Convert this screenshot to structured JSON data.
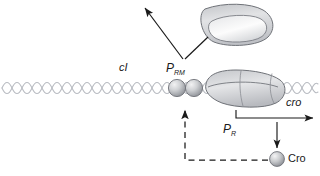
{
  "figure": {
    "background_color": "#ffffff",
    "stroke_color": "#1a1a1a",
    "dna_color": "#b9bcc2",
    "protein_fill": "#d9dadd"
  },
  "labels": {
    "ci_gene": "cI",
    "cro_gene": "cro",
    "prm_promoter_base": "P",
    "prm_promoter_sub": "RM",
    "pr_promoter_base": "P",
    "pr_promoter_sub": "R",
    "cro_protein": "Cro"
  },
  "elements": {
    "dna_strand": "double-helix-dna",
    "repressor_dimer_left": "ci-repressor-sphere-left",
    "repressor_dimer_right": "ci-repressor-sphere-right",
    "rna_polymerase_bound": "rna-polymerase-blob-bound",
    "rna_polymerase_free": "rna-polymerase-blob-free",
    "cro_sphere": "cro-protein-sphere",
    "pointer_arrow": "prm-pointer-arrow",
    "pointer_line": "prm-leader-line",
    "pr_transcription_arrow": "pr-transcription-arrow",
    "cro_production_arrow": "cro-production-arrow",
    "feedback_dashed_path": "cro-feedback-dashed-path"
  }
}
